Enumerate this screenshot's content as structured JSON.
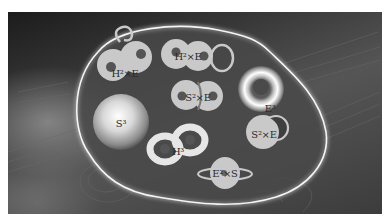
{
  "figure": {
    "background_colors": {
      "dark": "#1c1c1c",
      "mid": "#555555",
      "border": "#ffffff"
    },
    "boundary": {
      "color": "#f2f2f2",
      "glow": true
    },
    "items": [
      {
        "id": "h2xe-left",
        "shape": "double-disk-with-loop",
        "label": "H²×E"
      },
      {
        "id": "h2xe-top",
        "shape": "double-disk-with-ring",
        "label": "H²×E"
      },
      {
        "id": "s2xe-center",
        "shape": "double-disk-with-arc",
        "label": "S²×E"
      },
      {
        "id": "torus",
        "shape": "torus",
        "label": "E³"
      },
      {
        "id": "sphere",
        "shape": "sphere",
        "label": "S³"
      },
      {
        "id": "double-torus",
        "shape": "genus-2-surface",
        "label": "H³"
      },
      {
        "id": "s2xe-right",
        "shape": "disk-with-ring",
        "label": "S²×E"
      },
      {
        "id": "e2xs-bottom",
        "shape": "disk-with-orbit",
        "label": "E²×S"
      }
    ]
  }
}
